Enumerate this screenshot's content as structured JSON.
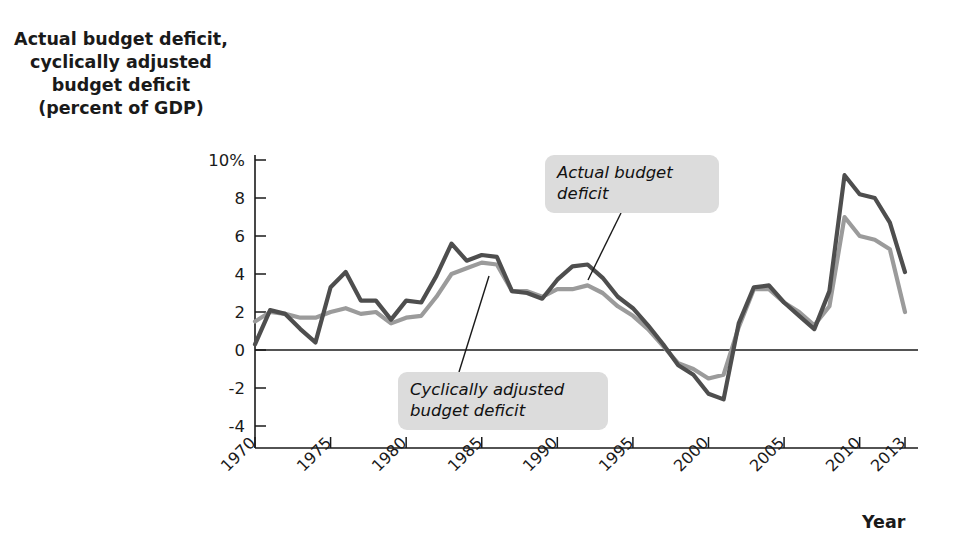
{
  "chart_data": {
    "type": "line",
    "title": "",
    "ylabel": "Actual budget deficit,\ncyclically adjusted\nbudget deficit\n(percent of GDP)",
    "xlabel": "Year",
    "grid": false,
    "zero_line": true,
    "legend_position": "inline-callouts",
    "xlim": [
      1970,
      2013.6
    ],
    "ylim": [
      -5,
      11
    ],
    "yticks": [
      10,
      8,
      6,
      4,
      2,
      0,
      -2,
      -4
    ],
    "ytick_labels": [
      "10%",
      "8",
      "6",
      "4",
      "2",
      "0",
      "-2",
      "-4"
    ],
    "xticks": [
      1970,
      1975,
      1980,
      1985,
      1990,
      1995,
      2000,
      2005,
      2010,
      2013
    ],
    "xtick_labels": [
      "1970",
      "1975",
      "1980",
      "1985",
      "1990",
      "1995",
      "2000",
      "2005",
      "2010",
      "2013"
    ],
    "x": [
      1970,
      1971,
      1972,
      1973,
      1974,
      1975,
      1976,
      1977,
      1978,
      1979,
      1980,
      1981,
      1982,
      1983,
      1984,
      1985,
      1986,
      1987,
      1988,
      1989,
      1990,
      1991,
      1992,
      1993,
      1994,
      1995,
      1996,
      1997,
      1998,
      1999,
      2000,
      2001,
      2002,
      2003,
      2004,
      2005,
      2006,
      2007,
      2008,
      2009,
      2010,
      2011,
      2012,
      2013
    ],
    "series": [
      {
        "name": "Actual budget deficit",
        "color": "#4e4e4e",
        "values": [
          0.3,
          2.1,
          1.9,
          1.1,
          0.4,
          3.3,
          4.1,
          2.6,
          2.6,
          1.6,
          2.6,
          2.5,
          3.9,
          5.6,
          4.7,
          5.0,
          4.9,
          3.1,
          3.0,
          2.7,
          3.7,
          4.4,
          4.5,
          3.8,
          2.8,
          2.2,
          1.3,
          0.3,
          -0.8,
          -1.3,
          -2.3,
          -2.6,
          1.4,
          3.3,
          3.4,
          2.5,
          1.8,
          1.1,
          3.1,
          9.2,
          8.2,
          8.0,
          6.7,
          4.1
        ]
      },
      {
        "name": "Cyclically adjusted budget deficit",
        "color": "#9b9b9b",
        "values": [
          1.5,
          2.0,
          1.9,
          1.7,
          1.7,
          2.0,
          2.2,
          1.9,
          2.0,
          1.4,
          1.7,
          1.8,
          2.8,
          4.0,
          4.3,
          4.6,
          4.5,
          3.1,
          3.1,
          2.8,
          3.2,
          3.2,
          3.4,
          3.0,
          2.3,
          1.8,
          1.1,
          0.2,
          -0.7,
          -1.0,
          -1.5,
          -1.3,
          1.2,
          3.2,
          3.2,
          2.5,
          2.0,
          1.3,
          2.3,
          7.0,
          6.0,
          5.8,
          5.3,
          2.0
        ]
      }
    ],
    "annotations": [
      {
        "id": "actual-callout",
        "text": "Actual budget\ndeficit",
        "target_year": 1992.5,
        "target_value": 4.4
      },
      {
        "id": "cyclical-callout",
        "text": "Cyclically adjusted\nbudget deficit",
        "target_year": 1984.4,
        "target_value": 4.3
      }
    ]
  },
  "labels": {
    "ylabel_line1": "Actual budget deficit,",
    "ylabel_line2": "cyclically adjusted",
    "ylabel_line3": "budget deficit",
    "ylabel_line4": "(percent of GDP)",
    "xlabel": "Year",
    "callout_actual": "Actual budget\ndeficit",
    "callout_cyclical": "Cyclically adjusted\nbudget deficit"
  },
  "colors": {
    "actual_line": "#4e4e4e",
    "cyclical_line": "#9b9b9b",
    "axis": "#1a1a1a",
    "callout_bg": "#dcdcdc",
    "text": "#1a1a1a"
  }
}
